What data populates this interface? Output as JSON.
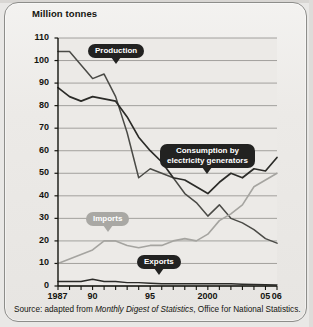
{
  "figure": {
    "axis_title": "Million tonnes",
    "source_prefix": "Source:  adapted from ",
    "source_italic": "Monthly Digest of Statistics",
    "source_suffix": ", Office for National Statistics."
  },
  "labels": {
    "production": "Production",
    "consumption_line1": "Consumption by",
    "consumption_line2": "electricity generators",
    "imports": "Imports",
    "exports": "Exports"
  },
  "colors": {
    "callout_dark": "#222221",
    "callout_light": "#a9a8a4",
    "line_dark": "#2b2b28",
    "line_mid": "#4a4a46",
    "line_light": "#a5a4a0",
    "plot_bg": "#eceae7",
    "grid": "#8f8e8a"
  },
  "chart_data": {
    "type": "line",
    "title": "",
    "subtitle": "",
    "xlabel": "",
    "ylabel": "Million tonnes",
    "xlim": [
      1987,
      2006
    ],
    "ylim": [
      0,
      110
    ],
    "ytick_step": 10,
    "grid": true,
    "legend": "inline-callouts",
    "yticks": [
      0,
      10,
      20,
      30,
      40,
      50,
      60,
      70,
      80,
      90,
      100,
      110
    ],
    "xticks": [
      1987,
      1988,
      1989,
      1990,
      1991,
      1992,
      1993,
      1994,
      1995,
      1996,
      1997,
      1998,
      1999,
      2000,
      2001,
      2002,
      2003,
      2004,
      2005,
      2006
    ],
    "xtick_labels": [
      {
        "x": 1987,
        "label": "1987"
      },
      {
        "x": 1990,
        "label": "90"
      },
      {
        "x": 1995,
        "label": "95"
      },
      {
        "x": 2000,
        "label": "2000"
      },
      {
        "x": 2005,
        "label": "05"
      },
      {
        "x": 2006,
        "label": "06"
      }
    ],
    "x": [
      1987,
      1988,
      1989,
      1990,
      1991,
      1992,
      1993,
      1994,
      1995,
      1996,
      1997,
      1998,
      1999,
      2000,
      2001,
      2002,
      2003,
      2004,
      2005,
      2006
    ],
    "series": [
      {
        "name": "Production",
        "values": [
          104,
          104,
          98,
          92,
          94,
          84,
          68,
          48,
          52,
          50,
          48,
          41,
          37,
          31,
          36,
          30,
          28,
          25,
          21,
          19
        ]
      },
      {
        "name": "Consumption by electricity generators",
        "values": [
          88,
          84,
          82,
          84,
          83,
          82,
          75,
          66,
          60,
          55,
          48,
          47,
          44,
          41,
          46,
          50,
          48,
          52,
          51,
          57
        ]
      },
      {
        "name": "Imports",
        "values": [
          10,
          12,
          14,
          16,
          20,
          20,
          18,
          17,
          18,
          18,
          20,
          21,
          20,
          23,
          29,
          32,
          36,
          44,
          47,
          50
        ]
      },
      {
        "name": "Exports",
        "values": [
          2,
          2,
          2,
          3,
          2,
          2,
          1.5,
          1.5,
          1.2,
          1,
          1,
          1,
          1,
          1,
          1,
          1,
          0.8,
          0.7,
          0.6,
          0.5
        ]
      }
    ]
  }
}
